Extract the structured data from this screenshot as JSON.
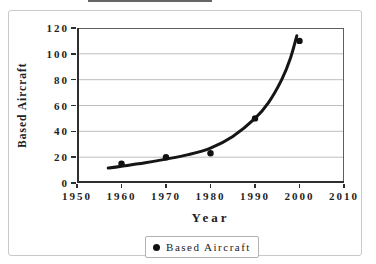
{
  "colors": {
    "background": "#ffffff",
    "text": "#1e1e1e",
    "curve": "#151515",
    "marker": "#111111",
    "grid": "#bdbdbd",
    "plot_border": "#5f5f5f",
    "axis": "#2f2f2f",
    "outer_border": "#c9c9c9",
    "legend_border": "#b3b3b3",
    "artifact_line": "#4a4a4a"
  },
  "chart_data": {
    "type": "scatter",
    "title": "",
    "xlabel": "Year",
    "ylabel": "Based Aircraft",
    "xlim": [
      1950,
      2010
    ],
    "ylim": [
      0,
      120
    ],
    "x_ticks": [
      1950,
      1960,
      1970,
      1980,
      1990,
      2000,
      2010
    ],
    "y_ticks": [
      0,
      20,
      40,
      60,
      80,
      100,
      120
    ],
    "grid": "horizontal-only",
    "legend_position": "bottom-center",
    "series": [
      {
        "name": "Based Aircraft",
        "type": "scatter",
        "marker": "filled-circle",
        "x": [
          1960,
          1970,
          1980,
          1990,
          2000
        ],
        "y": [
          15,
          20,
          23,
          50,
          110
        ]
      }
    ],
    "trendline": {
      "style": "smooth-thick-curve",
      "x": [
        1957,
        1960,
        1965,
        1970,
        1975,
        1980,
        1985,
        1990,
        1993,
        1996,
        1998,
        1999.4
      ],
      "y": [
        11.5,
        13,
        15.5,
        18.5,
        22,
        27,
        36,
        50,
        62,
        80,
        97,
        114
      ]
    },
    "legend": {
      "entries": [
        {
          "label": "Based Aircraft",
          "marker": "filled-circle"
        }
      ]
    }
  }
}
